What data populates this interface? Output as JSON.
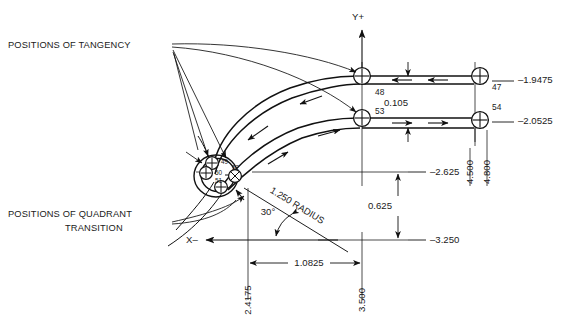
{
  "drawing": {
    "title": "Cutter path geometry with tangency and quadrant transition positions",
    "background": "#ffffff",
    "line_color": "#111111",
    "callouts": {
      "tangency": "POSITIONS OF TANGENCY",
      "quadrant_line1": "POSITIONS OF QUADRANT",
      "quadrant_line2": "TRANSITION"
    },
    "axes": {
      "y_positive": "Y+",
      "x_negative": "X–"
    },
    "point_bubbles": [
      {
        "id": "47",
        "label": "47"
      },
      {
        "id": "48",
        "label": "48"
      },
      {
        "id": "53",
        "label": "53"
      },
      {
        "id": "54",
        "label": "54"
      },
      {
        "id": "49",
        "label": "49"
      },
      {
        "id": "50",
        "label": "50"
      },
      {
        "id": "51",
        "label": "51"
      },
      {
        "id": "52",
        "label": "52"
      }
    ],
    "dimensions": {
      "gap_vertical": "0.105",
      "y_47": "–1.9475",
      "y_54": "–2.0525",
      "y_upper_ref": "–2.625",
      "y_lower_ref": "–3.250",
      "vertical_between_refs": "0.625",
      "horizontal_span": "1.0825",
      "x_left_ref": "2.4175",
      "x_right_ref": "3.500",
      "x_far_ref_a": "4.500",
      "x_far_ref_b": "4.800",
      "radius_note": "1.250 RADIUS",
      "angle_note": "30°"
    }
  }
}
